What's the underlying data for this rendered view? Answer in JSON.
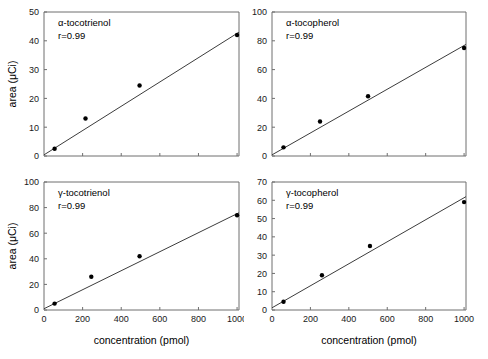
{
  "figure": {
    "panel_count": 4,
    "shared_ylabel": "area (μCi)",
    "shared_xlabel": "concentration (pmol)",
    "correlation_text": "r=0.99"
  },
  "chart_data": [
    {
      "type": "scatter",
      "title": "α-tocotrienol",
      "annotation": "r=0.99",
      "xlabel": "",
      "ylabel": "area (μCi)",
      "x": [
        55,
        215,
        495,
        1000
      ],
      "y": [
        2.5,
        13.0,
        24.5,
        42.0
      ],
      "xlim": [
        0,
        1010
      ],
      "ylim": [
        0,
        50
      ],
      "xticks": [
        0,
        200,
        400,
        600,
        800,
        1000
      ],
      "xticklabels": [
        "",
        "",
        "",
        "",
        "",
        ""
      ],
      "yticks": [
        0,
        10,
        20,
        30,
        40,
        50
      ],
      "yticklabels": [
        "0",
        "10",
        "20",
        "30",
        "40",
        "50"
      ],
      "grid": false,
      "legend": "none",
      "fit_line": {
        "x0": 0,
        "y0": 0.4,
        "x1": 1010,
        "y1": 43.0
      }
    },
    {
      "type": "scatter",
      "title": "α-tocopherol",
      "annotation": "r=0.99",
      "xlabel": "",
      "ylabel": "",
      "x": [
        60,
        250,
        500,
        1000
      ],
      "y": [
        6.0,
        24.0,
        41.5,
        75.0
      ],
      "xlim": [
        0,
        1010
      ],
      "ylim": [
        0,
        100
      ],
      "xticks": [
        0,
        200,
        400,
        600,
        800,
        1000
      ],
      "xticklabels": [
        "",
        "",
        "",
        "",
        "",
        ""
      ],
      "yticks": [
        0,
        20,
        40,
        60,
        80,
        100
      ],
      "yticklabels": [
        "0",
        "20",
        "40",
        "60",
        "80",
        "100"
      ],
      "grid": false,
      "legend": "none",
      "fit_line": {
        "x0": 0,
        "y0": 0.8,
        "x1": 1010,
        "y1": 77.5
      }
    },
    {
      "type": "scatter",
      "title": "γ-tocotrienol",
      "annotation": "r=0.99",
      "xlabel": "concentration (pmol)",
      "ylabel": "area (μCi)",
      "x": [
        55,
        245,
        495,
        1000
      ],
      "y": [
        5.0,
        26.0,
        42.0,
        74.0
      ],
      "xlim": [
        0,
        1010
      ],
      "ylim": [
        0,
        100
      ],
      "xticks": [
        0,
        200,
        400,
        600,
        800,
        1000
      ],
      "xticklabels": [
        "0",
        "200",
        "400",
        "600",
        "800",
        "1000"
      ],
      "yticks": [
        0,
        20,
        40,
        60,
        80,
        100
      ],
      "yticklabels": [
        "0",
        "20",
        "40",
        "60",
        "80",
        "100"
      ],
      "grid": false,
      "legend": "none",
      "fit_line": {
        "x0": 0,
        "y0": 1.0,
        "x1": 1010,
        "y1": 76.0
      }
    },
    {
      "type": "scatter",
      "title": "γ-tocopherol",
      "annotation": "r=0.99",
      "xlabel": "concentration (pmol)",
      "ylabel": "",
      "x": [
        60,
        260,
        510,
        1000
      ],
      "y": [
        4.5,
        19.0,
        35.0,
        59.0
      ],
      "xlim": [
        0,
        1010
      ],
      "ylim": [
        0,
        70
      ],
      "xticks": [
        0,
        200,
        400,
        600,
        800,
        1000
      ],
      "xticklabels": [
        "0",
        "200",
        "400",
        "600",
        "800",
        "1000"
      ],
      "yticks": [
        0,
        10,
        20,
        30,
        40,
        50,
        60,
        70
      ],
      "yticklabels": [
        "0",
        "10",
        "20",
        "30",
        "40",
        "50",
        "60",
        "70"
      ],
      "grid": false,
      "legend": "none",
      "fit_line": {
        "x0": 0,
        "y0": 1.2,
        "x1": 1010,
        "y1": 62.0
      }
    }
  ]
}
